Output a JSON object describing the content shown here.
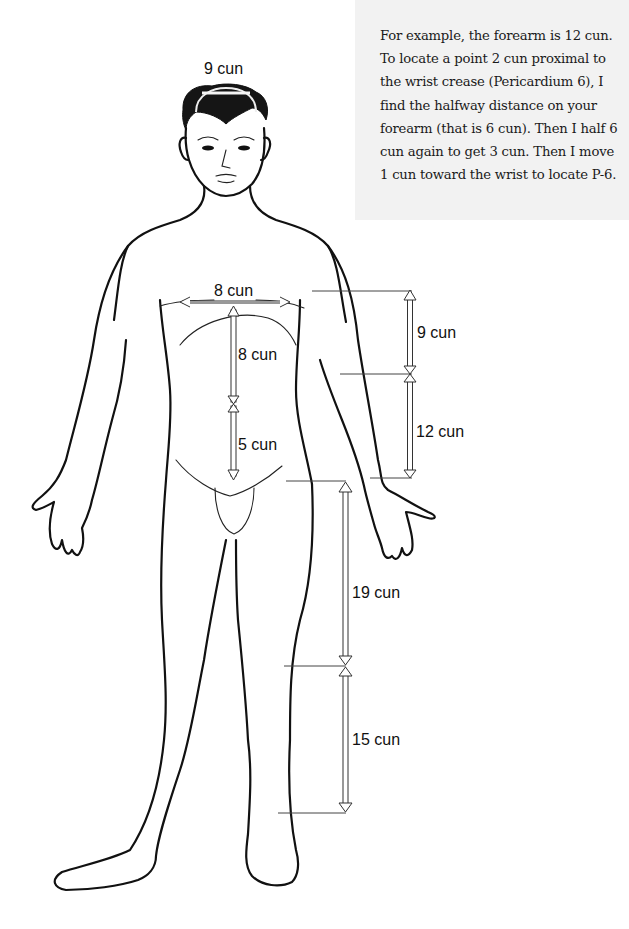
{
  "note": {
    "text": "For example, the forearm is 12 cun. To locate a point 2 cun proximal to the wrist crease (Pericardium 6), I find the halfway distance on your forearm (that is 6 cun). Then I half 6 cun again to get 3 cun. Then I move 1 cun toward the wrist to locate P-6."
  },
  "measurements": {
    "head_width": "9 cun",
    "chest_width": "8 cun",
    "sternum_to_navel": "8 cun",
    "navel_to_pubis": "5 cun",
    "upper_arm": "9 cun",
    "forearm": "12 cun",
    "thigh": "19 cun",
    "lower_leg": "15 cun"
  },
  "colors": {
    "note_background": "#f2f2f2",
    "line": "#111111"
  }
}
